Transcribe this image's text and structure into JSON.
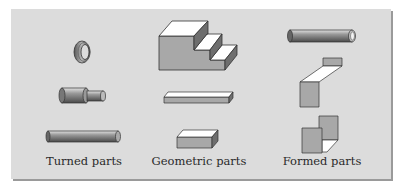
{
  "figure": {
    "columns": [
      {
        "caption": "Turned parts",
        "items": [
          "ring",
          "stepped-shaft",
          "rod"
        ]
      },
      {
        "caption": "Geometric parts",
        "items": [
          "stepped-block",
          "flat-bar",
          "rectangular-block"
        ]
      },
      {
        "caption": "Formed parts",
        "items": [
          "tube",
          "z-bend-bracket",
          "folded-sheet"
        ]
      }
    ],
    "colors": {
      "background": "#dcdcdc",
      "shadow": "#9a9a9a",
      "face_gray": "#a8a8a8",
      "face_dark": "#6e6e6e",
      "face_light": "#ffffff",
      "outline": "#3a3a3a"
    }
  }
}
